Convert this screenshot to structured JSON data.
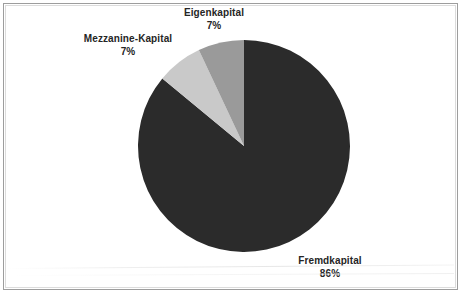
{
  "chart_data": {
    "type": "pie",
    "title": "",
    "subtitle": "",
    "xlabel": "",
    "ylabel": "",
    "legend_position": "none",
    "grid": false,
    "labels_outside": true,
    "start_angle_deg": 0,
    "direction": "clockwise",
    "categories": [
      "Fremdkapital",
      "Mezzanine-Kapital",
      "Eigenkapital"
    ],
    "values": [
      86,
      7,
      7
    ],
    "value_unit": "%",
    "slices": [
      {
        "name": "Fremdkapital",
        "value": 86,
        "value_text": "86%",
        "color": "#2b2b2b",
        "start_angle_deg": 0,
        "end_angle_deg": 309.6
      },
      {
        "name": "Mezzanine-Kapital",
        "value": 7,
        "value_text": "7%",
        "color": "#c9c9c9",
        "start_angle_deg": 309.6,
        "end_angle_deg": 334.8
      },
      {
        "name": "Eigenkapital",
        "value": 7,
        "value_text": "7%",
        "color": "#9a9a9a",
        "start_angle_deg": 334.8,
        "end_angle_deg": 360
      }
    ]
  },
  "labels": {
    "eigenkapital": {
      "name": "Eigenkapital",
      "value_text": "7%"
    },
    "mezzanine": {
      "name": "Mezzanine-Kapital",
      "value_text": "7%"
    },
    "fremdkapital": {
      "name": "Fremdkapital",
      "value_text": "86%"
    }
  },
  "colors": {
    "fremdkapital": "#2b2b2b",
    "mezzanine": "#c9c9c9",
    "eigenkapital": "#9a9a9a",
    "background": "#ffffff",
    "frame_border": "#9d9d9d",
    "label_text": "#252525"
  },
  "geometry": {
    "center_x": 244,
    "center_y": 146,
    "radius": 106
  }
}
